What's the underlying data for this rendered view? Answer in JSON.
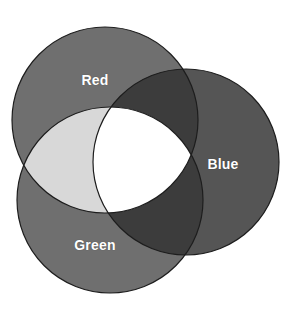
{
  "figure": {
    "background_color": "#ffffff",
    "width": 297,
    "height": 310
  },
  "chart_data": {
    "type": "diagram",
    "subtype": "venn-3-set",
    "title": "",
    "sets": [
      {
        "id": "red",
        "label": "Red",
        "cx": 105,
        "cy": 120,
        "r": 93,
        "fill": "#6f6f6f",
        "label_x": 95,
        "label_y": 80
      },
      {
        "id": "blue",
        "label": "Blue",
        "cx": 186,
        "cy": 162,
        "r": 93,
        "fill": "#555555",
        "label_x": 223,
        "label_y": 164
      },
      {
        "id": "green",
        "label": "Green",
        "cx": 110,
        "cy": 200,
        "r": 93,
        "fill": "#6f6f6f",
        "label_x": 95,
        "label_y": 245
      }
    ],
    "regions": [
      {
        "id": "red-only",
        "members": [
          "Red"
        ],
        "fill": "#6f6f6f"
      },
      {
        "id": "blue-only",
        "members": [
          "Blue"
        ],
        "fill": "#555555"
      },
      {
        "id": "green-only",
        "members": [
          "Green"
        ],
        "fill": "#6f6f6f"
      },
      {
        "id": "red-blue",
        "members": [
          "Red",
          "Blue"
        ],
        "fill": "#3c3c3c"
      },
      {
        "id": "green-blue",
        "members": [
          "Green",
          "Blue"
        ],
        "fill": "#3c3c3c"
      },
      {
        "id": "red-green",
        "members": [
          "Red",
          "Green"
        ],
        "fill": "#d8d8d8"
      },
      {
        "id": "red-green-blue",
        "members": [
          "Red",
          "Green",
          "Blue"
        ],
        "fill": "#ffffff"
      }
    ],
    "stroke": {
      "color": "#1d1d1d",
      "width": 1.2
    },
    "label_color": "#ffffff",
    "legend": "none",
    "grid": false
  }
}
